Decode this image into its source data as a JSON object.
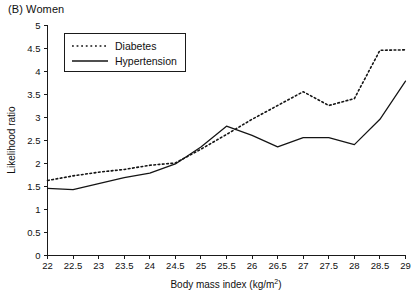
{
  "panel": {
    "label": "(B) Women"
  },
  "chart_data": {
    "type": "line",
    "title": "(B) Women",
    "xlabel": "Body mass index (kg/m2)",
    "xlabel_display": "Body mass index (kg/m",
    "xlabel_superscript": "2",
    "xlabel_suffix": ")",
    "ylabel": "Likelihood ratio",
    "xlim": [
      22,
      29
    ],
    "ylim": [
      0,
      5
    ],
    "xticks": [
      "22",
      "22.5",
      "23",
      "23.5",
      "24",
      "24.5",
      "25",
      "25.5",
      "26",
      "26.5",
      "27",
      "27.5",
      "28",
      "28.5",
      "29"
    ],
    "xtick_values": [
      22,
      22.5,
      23,
      23.5,
      24,
      24.5,
      25,
      25.5,
      26,
      26.5,
      27,
      27.5,
      28,
      28.5,
      29
    ],
    "yticks": [
      "0",
      "0.5",
      "1",
      "1.5",
      "2",
      "2.5",
      "3",
      "3.5",
      "4",
      "4.5",
      "5"
    ],
    "ytick_values": [
      0,
      0.5,
      1,
      1.5,
      2,
      2.5,
      3,
      3.5,
      4,
      4.5,
      5
    ],
    "grid": false,
    "legend_position": "top-left-inside",
    "x": [
      22,
      22.5,
      23,
      23.5,
      24,
      24.5,
      25,
      25.5,
      26,
      26.5,
      27,
      27.5,
      28,
      28.5,
      29
    ],
    "series": [
      {
        "name": "Diabetes",
        "style": "dotted",
        "values": [
          1.62,
          1.72,
          1.8,
          1.86,
          1.95,
          2.0,
          2.3,
          2.62,
          2.95,
          3.25,
          3.55,
          3.25,
          3.4,
          4.45,
          4.46
        ]
      },
      {
        "name": "Hypertension",
        "style": "solid",
        "values": [
          1.45,
          1.42,
          1.55,
          1.68,
          1.78,
          1.98,
          2.35,
          2.8,
          2.6,
          2.35,
          2.55,
          2.55,
          2.4,
          2.95,
          3.78
        ]
      }
    ]
  },
  "legend": {
    "items": [
      {
        "label": "Diabetes",
        "style": "dotted"
      },
      {
        "label": "Hypertension",
        "style": "solid"
      }
    ]
  }
}
